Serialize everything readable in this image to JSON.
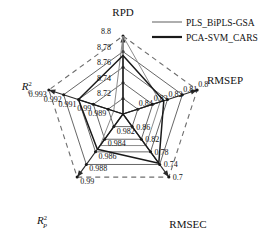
{
  "chart_data": {
    "type": "radar",
    "title": "",
    "grid": true,
    "legend_position": "top-right",
    "axes": [
      {
        "name": "RPD",
        "label": "RPD",
        "angle_deg": -90,
        "ticks": [
          "8.8",
          "8.78",
          "8.76",
          "8.74",
          "8.72"
        ],
        "range": [
          8.72,
          8.8
        ],
        "direction": "outward-increasing"
      },
      {
        "name": "RMSEP",
        "label": "RMSEP",
        "angle_deg": -18,
        "ticks": [
          "0.8",
          "0.81",
          "0.82",
          "0.83",
          "0.84"
        ],
        "range": [
          0.84,
          0.8
        ],
        "direction": "outward-decreasing"
      },
      {
        "name": "RMSEC",
        "label": "RMSEC",
        "angle_deg": 54,
        "ticks": [
          "0.7",
          "0.74",
          "0.78",
          "0.82",
          "0.86"
        ],
        "range": [
          0.86,
          0.7
        ],
        "direction": "outward-decreasing"
      },
      {
        "name": "R2p",
        "label": "R",
        "label_sub": "P",
        "label_sup": "2",
        "angle_deg": 126,
        "ticks": [
          "0.99",
          "0.988",
          "0.986",
          "0.984",
          "0.982"
        ],
        "range": [
          0.982,
          0.99
        ],
        "direction": "outward-increasing"
      },
      {
        "name": "R2c",
        "label": "R",
        "label_sub": "C",
        "label_sup": "2",
        "angle_deg": 198,
        "ticks": [
          "0.993",
          "0.992",
          "0.991",
          "0.99",
          "0.989"
        ],
        "range": [
          0.989,
          0.993
        ],
        "direction": "outward-increasing"
      }
    ],
    "categories": [
      "RPD",
      "RMSEP",
      "RMSEC",
      "R2p",
      "R2c"
    ],
    "series": [
      {
        "name": "PLS_BiPLS-GSA",
        "color": "#8c8c8c",
        "values": [
          8.8,
          0.82,
          0.78,
          0.986,
          0.9895
        ],
        "normalized": [
          1.0,
          0.5,
          0.5,
          0.5,
          0.125
        ]
      },
      {
        "name": "PCA-SVM_CARS",
        "color": "#1a1a1a",
        "values": [
          8.75,
          0.818,
          0.745,
          0.9865,
          0.9915
        ],
        "normalized": [
          0.75,
          0.55,
          0.78,
          0.56,
          0.6
        ]
      }
    ],
    "tick_rings": [
      0.2,
      0.4,
      0.6,
      0.8,
      1.0
    ],
    "outer_ring_style": "dashed",
    "inner_ring_style": "solid"
  },
  "legend": {
    "items": [
      {
        "label": "PLS_BiPLS-GSA",
        "color": "#8c8c8c",
        "width": 1.4
      },
      {
        "label": "PCA-SVM_CARS",
        "color": "#1a1a1a",
        "width": 2.2
      }
    ]
  }
}
